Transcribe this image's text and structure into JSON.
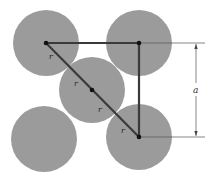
{
  "diagram": {
    "type": "body-centered atom packing cross-section",
    "colors": {
      "atom_fill": "#9b9b9b",
      "line": "#3a3a3a",
      "dim_line": "#555555",
      "background": "#ffffff"
    },
    "atoms": [
      {
        "id": "top-left",
        "cx": 46,
        "cy": 43,
        "r": 33
      },
      {
        "id": "top-right",
        "cx": 139,
        "cy": 43,
        "r": 33
      },
      {
        "id": "center",
        "cx": 92,
        "cy": 90,
        "r": 33
      },
      {
        "id": "bottom-left",
        "cx": 44,
        "cy": 139,
        "r": 33
      },
      {
        "id": "bottom-right",
        "cx": 139,
        "cy": 137,
        "r": 33
      }
    ],
    "labels": {
      "radius_1": "r",
      "radius_2": "r",
      "radius_3": "r",
      "radius_4": "r",
      "dimension": "a"
    }
  }
}
